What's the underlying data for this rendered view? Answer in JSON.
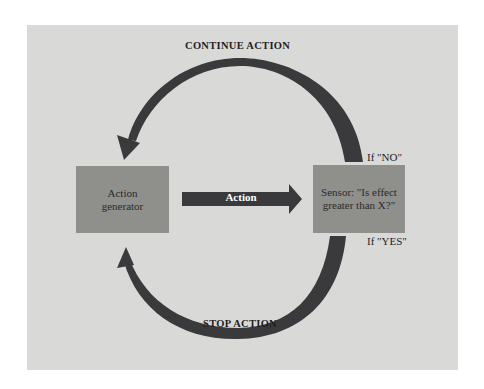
{
  "diagram": {
    "title_top": "CONTINUE ACTION",
    "title_bottom": "STOP ACTION",
    "nodes": {
      "generator": {
        "label": "Action generator",
        "line1": "Action",
        "line2": "generator"
      },
      "sensor": {
        "label": "Sensor: \"Is effect greater than X?\"",
        "line1": "Sensor: \"Is effect",
        "line2": "greater than X?\""
      }
    },
    "edges": {
      "action": {
        "label": "Action",
        "from": "generator",
        "to": "sensor"
      },
      "no_branch": {
        "label": "If \"NO\"",
        "from": "sensor",
        "to": "generator",
        "meaning": "CONTINUE ACTION"
      },
      "yes_branch": {
        "label": "If \"YES\"",
        "from": "sensor",
        "to": "generator",
        "meaning": "STOP ACTION"
      }
    },
    "colors": {
      "background": "#d9d9d7",
      "box": "#8f8f8c",
      "arrow": "#3a3a3d"
    }
  }
}
